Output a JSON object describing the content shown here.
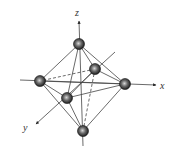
{
  "diagram": {
    "axes": {
      "x": {
        "label": "x"
      },
      "y": {
        "label": "y"
      },
      "z": {
        "label": "z"
      }
    },
    "atoms": [
      {
        "id": "top",
        "position": "+z"
      },
      {
        "id": "bottom",
        "position": "-z"
      },
      {
        "id": "left",
        "position": "-x"
      },
      {
        "id": "right",
        "position": "+x"
      },
      {
        "id": "back",
        "position": "-y"
      },
      {
        "id": "front",
        "position": "+y"
      }
    ],
    "colors": {
      "line": "#444444",
      "sphere_dark": "#1a1a1a",
      "sphere_mid": "#555555",
      "sphere_highlight": "#cfcfcf"
    }
  }
}
